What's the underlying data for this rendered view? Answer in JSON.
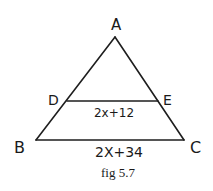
{
  "figure": {
    "caption": "fig 5.7",
    "points": {
      "A": "A",
      "B": "B",
      "C": "C",
      "D": "D",
      "E": "E"
    },
    "segments": {
      "DE": {
        "label": "2x+12"
      },
      "BC": {
        "label": "2X+34"
      }
    },
    "ink_color": "#1e1e1e",
    "background": "#ffffff"
  }
}
